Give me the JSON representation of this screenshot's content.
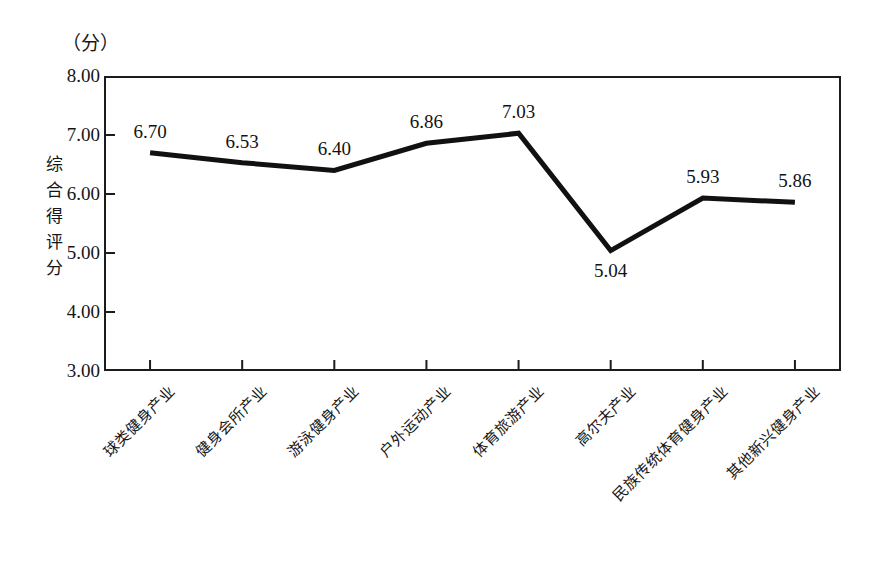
{
  "chart_data": {
    "type": "line",
    "title": "",
    "unit_label": "（分）",
    "ylabel": "综合得评分",
    "xlabel": "",
    "ylim": [
      3.0,
      8.0
    ],
    "yticks": [
      "8.00",
      "7.00",
      "6.00",
      "5.00",
      "4.00",
      "3.00"
    ],
    "ytick_values": [
      8.0,
      7.0,
      6.0,
      5.0,
      4.0,
      3.0
    ],
    "grid": false,
    "legend": "none",
    "categories": [
      "球类健身产业",
      "健身会所产业",
      "游泳健身产业",
      "户外运动产业",
      "体育旅游产业",
      "高尔夫产业",
      "民族传统体育健身产业",
      "其他新兴健身产业"
    ],
    "values": [
      6.7,
      6.53,
      6.4,
      6.86,
      7.03,
      5.04,
      5.93,
      5.86
    ],
    "value_labels": [
      "6.70",
      "6.53",
      "6.40",
      "6.86",
      "7.03",
      "5.04",
      "5.93",
      "5.86"
    ],
    "label_positions": [
      "above",
      "above",
      "above",
      "above",
      "above",
      "below",
      "above",
      "above"
    ],
    "line_color": "#111111",
    "line_width": 5,
    "markers": "none"
  }
}
